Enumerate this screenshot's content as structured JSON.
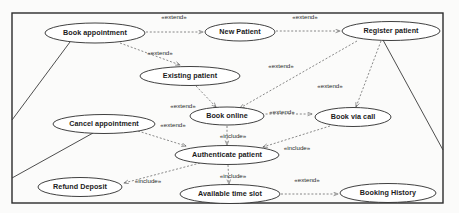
{
  "diagram": {
    "type": "uml-use-case-diagram",
    "frame": {
      "x": 12,
      "y": 13,
      "width": 431,
      "height": 190
    },
    "stereotypes": {
      "extend": "«extend»",
      "include": "«include»"
    },
    "use_cases": [
      {
        "id": "book_appointment",
        "label": "Book appointment",
        "cx": 95,
        "cy": 33,
        "rx": 50,
        "ry": 10
      },
      {
        "id": "new_patient",
        "label": "New Patient",
        "cx": 240,
        "cy": 32,
        "rx": 35,
        "ry": 9
      },
      {
        "id": "register_patient",
        "label": "Register patient",
        "cx": 391,
        "cy": 31,
        "rx": 49,
        "ry": 9.5
      },
      {
        "id": "existing_patient",
        "label": "Existing patient",
        "cx": 190,
        "cy": 76,
        "rx": 50,
        "ry": 9.5
      },
      {
        "id": "book_online",
        "label": "Book online",
        "cx": 227,
        "cy": 116,
        "rx": 37,
        "ry": 9
      },
      {
        "id": "book_via_call",
        "label": "Book via call",
        "cx": 353,
        "cy": 117,
        "rx": 38,
        "ry": 9.5
      },
      {
        "id": "cancel_appointment",
        "label": "Cancel appointment",
        "cx": 104,
        "cy": 124,
        "rx": 51,
        "ry": 9.5
      },
      {
        "id": "authenticate_patient",
        "label": "Authenticate patient",
        "cx": 227,
        "cy": 155,
        "rx": 52,
        "ry": 9.5
      },
      {
        "id": "refund_deposit",
        "label": "Refund Deposit",
        "cx": 80,
        "cy": 187,
        "rx": 42,
        "ry": 9.5
      },
      {
        "id": "available_time_slot",
        "label": "Available time slot",
        "cx": 230,
        "cy": 194,
        "rx": 50,
        "ry": 9.5
      },
      {
        "id": "booking_history",
        "label": "Booking History",
        "cx": 388,
        "cy": 193,
        "rx": 48,
        "ry": 9.5
      }
    ],
    "relationships": [
      {
        "id": "r1",
        "from": "book_appointment",
        "to": "new_patient",
        "kind": "extend",
        "label": "«extend»",
        "label_x": 174,
        "label_y": 17
      },
      {
        "id": "r2",
        "from": "new_patient",
        "to": "register_patient",
        "kind": "extend",
        "label": "«extend»",
        "label_x": 305,
        "label_y": 17
      },
      {
        "id": "r3",
        "from": "book_appointment",
        "to": "existing_patient",
        "kind": "extend",
        "label": "«extend»",
        "label_x": 160,
        "label_y": 53
      },
      {
        "id": "r4",
        "from": "register_patient",
        "to": "book_online",
        "kind": "extend",
        "label": "«extend»",
        "label_x": 281,
        "label_y": 66
      },
      {
        "id": "r5",
        "from": "existing_patient",
        "to": "book_online",
        "kind": "extend",
        "label": "«extend»",
        "label_x": 183,
        "label_y": 106
      },
      {
        "id": "r6",
        "from": "register_patient",
        "to": "book_via_call",
        "kind": "extend",
        "label": "«extend»",
        "label_x": 330,
        "label_y": 86
      },
      {
        "id": "r7",
        "from": "book_online",
        "to": "book_via_call",
        "kind": "extend",
        "label": "«extend»",
        "label_x": 280,
        "label_y": 112
      },
      {
        "id": "r8",
        "from": "cancel_appointment",
        "to": "authenticate_patient",
        "kind": "extend",
        "label": "«extend»",
        "label_x": 173,
        "label_y": 125
      },
      {
        "id": "r9",
        "from": "book_online",
        "to": "authenticate_patient",
        "kind": "include",
        "label": "«include»",
        "label_x": 232,
        "label_y": 136
      },
      {
        "id": "r10",
        "from": "book_via_call",
        "to": "authenticate_patient",
        "kind": "include",
        "label": "«include»",
        "label_x": 295,
        "label_y": 148
      },
      {
        "id": "r11",
        "from": "authenticate_patient",
        "to": "available_time_slot",
        "kind": "include",
        "label": "«include»",
        "label_x": 232,
        "label_y": 176
      },
      {
        "id": "r12",
        "from": "cancel_appointment",
        "to": "refund_deposit",
        "kind": "include",
        "label": "«include»",
        "label_x": 148,
        "label_y": 180
      },
      {
        "id": "r13",
        "from": "available_time_slot",
        "to": "booking_history",
        "kind": "extend",
        "label": "«extend»",
        "label_x": 307,
        "label_y": 180
      }
    ],
    "actor_associations": [
      {
        "id": "a1",
        "use_case": "book_appointment",
        "edge": "left"
      },
      {
        "id": "a2",
        "use_case": "cancel_appointment",
        "edge": "left"
      },
      {
        "id": "a3",
        "use_case": "register_patient",
        "edge": "right"
      }
    ]
  }
}
